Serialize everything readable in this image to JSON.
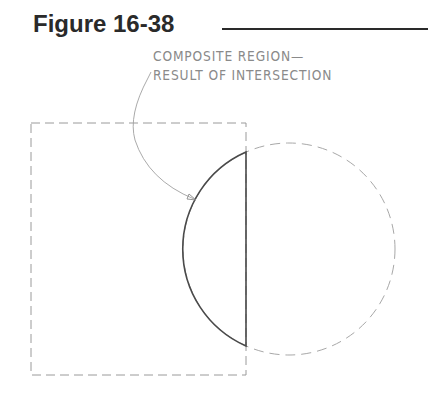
{
  "figure": {
    "title": "Figure 16-38",
    "label_line_1": "COMPOSITE REGION—",
    "label_line_2": "RESULT OF INTERSECTION"
  },
  "diagram": {
    "shapes": [
      {
        "name": "rectangle",
        "style": "dashed"
      },
      {
        "name": "circle",
        "style": "dashed"
      },
      {
        "name": "composite-region",
        "style": "solid",
        "description": "intersection of rectangle and circle"
      }
    ],
    "colors": {
      "title": "#2a2a2a",
      "label": "#8a8a8a",
      "dashed": "#9a9a9a",
      "region": "#4a4a4a",
      "leader": "#a0a0a0"
    }
  }
}
